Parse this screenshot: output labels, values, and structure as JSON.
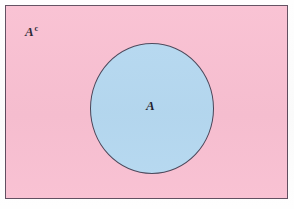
{
  "diagram": {
    "type": "venn-diagram",
    "universe": {
      "name": "universal-set-rectangle",
      "fill_color": "#f9c0d2",
      "border_color": "#5d4a5c",
      "label": "A",
      "label_superscript": "c"
    },
    "sets": [
      {
        "name": "set-a-circle",
        "label": "A",
        "fill_color": "#b6d9f1",
        "border_color": "#4a4558",
        "center_x": 146,
        "center_y": 102,
        "radius": 62
      }
    ],
    "background_color": "#fefefe"
  }
}
